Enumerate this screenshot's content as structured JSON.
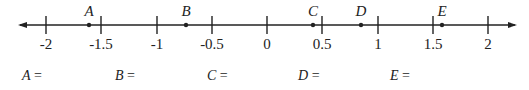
{
  "number_line": {
    "min": -2,
    "max": 2,
    "step": 0.5,
    "ticks": [
      {
        "value": -2,
        "label": "-2",
        "x": 46
      },
      {
        "value": -1.5,
        "label": "-1.5",
        "x": 101
      },
      {
        "value": -1,
        "label": "-1",
        "x": 157
      },
      {
        "value": -0.5,
        "label": "-0.5",
        "x": 212
      },
      {
        "value": 0,
        "label": "0",
        "x": 267
      },
      {
        "value": 0.5,
        "label": "0.5",
        "x": 322
      },
      {
        "value": 1,
        "label": "1",
        "x": 378
      },
      {
        "value": 1.5,
        "label": "1.5",
        "x": 433
      },
      {
        "value": 2,
        "label": "2",
        "x": 488
      }
    ],
    "points": [
      {
        "label": "A",
        "x": 89
      },
      {
        "label": "B",
        "x": 186
      },
      {
        "label": "C",
        "x": 313
      },
      {
        "label": "D",
        "x": 361
      },
      {
        "label": "E",
        "x": 442
      }
    ]
  },
  "answers": [
    {
      "label": "A",
      "eq": " =",
      "x": 22
    },
    {
      "label": "B",
      "eq": " =",
      "x": 115
    },
    {
      "label": "C",
      "eq": " =",
      "x": 207
    },
    {
      "label": "D",
      "eq": " =",
      "x": 298
    },
    {
      "label": "E",
      "eq": " =",
      "x": 390
    }
  ]
}
